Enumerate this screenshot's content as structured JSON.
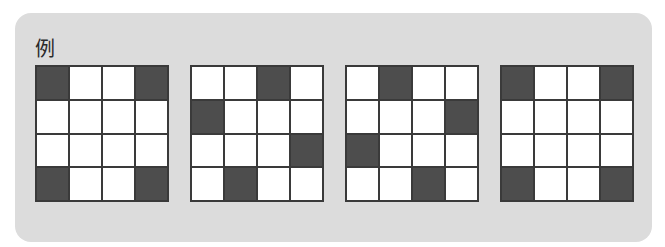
{
  "panel": {
    "label": "例"
  },
  "colors": {
    "filled": "#4d4d4d",
    "empty": "#ffffff",
    "border": "#3a3a3a",
    "panel_bg": "#dcdcdc"
  },
  "grids": [
    {
      "name": "grid-1",
      "rows": [
        [
          1,
          0,
          0,
          1
        ],
        [
          0,
          0,
          0,
          0
        ],
        [
          0,
          0,
          0,
          0
        ],
        [
          1,
          0,
          0,
          1
        ]
      ]
    },
    {
      "name": "grid-2",
      "rows": [
        [
          0,
          0,
          1,
          0
        ],
        [
          1,
          0,
          0,
          0
        ],
        [
          0,
          0,
          0,
          1
        ],
        [
          0,
          1,
          0,
          0
        ]
      ]
    },
    {
      "name": "grid-3",
      "rows": [
        [
          0,
          1,
          0,
          0
        ],
        [
          0,
          0,
          0,
          1
        ],
        [
          1,
          0,
          0,
          0
        ],
        [
          0,
          0,
          1,
          0
        ]
      ]
    },
    {
      "name": "grid-4",
      "rows": [
        [
          1,
          0,
          0,
          1
        ],
        [
          0,
          0,
          0,
          0
        ],
        [
          0,
          0,
          0,
          0
        ],
        [
          1,
          0,
          0,
          1
        ]
      ]
    }
  ]
}
